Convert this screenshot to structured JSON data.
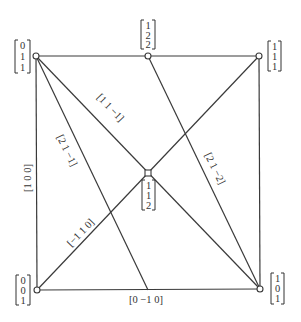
{
  "diagram": {
    "type": "projective-configuration",
    "vertices": [
      {
        "id": "TL",
        "x": 36,
        "y": 56,
        "coords": [
          "0",
          "1",
          "1"
        ]
      },
      {
        "id": "TM",
        "x": 148,
        "y": 56,
        "coords": [
          "1",
          "2",
          "2"
        ]
      },
      {
        "id": "TR",
        "x": 259,
        "y": 56,
        "coords": [
          "1",
          "1",
          "1"
        ]
      },
      {
        "id": "C",
        "x": 148,
        "y": 173,
        "coords": [
          "1",
          "1",
          "2"
        ]
      },
      {
        "id": "BL",
        "x": 37,
        "y": 290,
        "coords": [
          "0",
          "0",
          "1"
        ]
      },
      {
        "id": "BR",
        "x": 260,
        "y": 289,
        "coords": [
          "1",
          "0",
          "1"
        ]
      }
    ],
    "lines": [
      {
        "id": "top",
        "from": "TL",
        "to": "TR",
        "label": ""
      },
      {
        "id": "left",
        "from": "TL",
        "to": "BL",
        "label": "[1  0  0]"
      },
      {
        "id": "right",
        "from": "TR",
        "to": "BR",
        "label": ""
      },
      {
        "id": "bottom",
        "from": "BL",
        "to": "BR",
        "label": "[0  −1  0]"
      },
      {
        "id": "diag-tl-br",
        "from": "TL",
        "to": "BR",
        "label": "[1  1  −1]"
      },
      {
        "id": "diag-bl-tr",
        "from": "BL",
        "to": "TR",
        "label": "[−1  1  0]"
      },
      {
        "id": "line-tl-bottom",
        "from": "TL",
        "to": "bottom-mid",
        "label": "[2  1  −1]"
      },
      {
        "id": "line-tm-br",
        "from": "TM",
        "to": "BR",
        "label": "[2  1  −2]"
      }
    ],
    "labels": {
      "left": "[1  0  0]",
      "bottom": "[0  −1  0]",
      "d1": "[1  1  −1]",
      "d2": "[2  1  −1]",
      "d3": "[2  1  −2]",
      "d4": "[−1  1  0]"
    },
    "vectors": {
      "TL": [
        "0",
        "1",
        "1"
      ],
      "TM": [
        "1",
        "2",
        "2"
      ],
      "TR": [
        "1",
        "1",
        "1"
      ],
      "C": [
        "1",
        "1",
        "2"
      ],
      "BL": [
        "0",
        "0",
        "1"
      ],
      "BR": [
        "1",
        "0",
        "1"
      ]
    }
  }
}
